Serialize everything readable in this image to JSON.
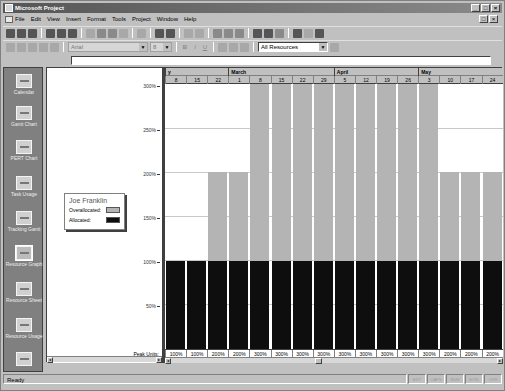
{
  "window": {
    "title": "Microsoft Project",
    "controls": [
      "minimize",
      "maximize",
      "close"
    ],
    "doc_controls": [
      "restore",
      "close"
    ]
  },
  "menu": {
    "items": [
      "File",
      "Edit",
      "View",
      "Insert",
      "Format",
      "Tools",
      "Project",
      "Window",
      "Help"
    ]
  },
  "toolbar": {
    "standard_icons": [
      "new-icon",
      "open-icon",
      "save-icon",
      "print-icon",
      "print-preview-icon",
      "spelling-icon",
      "cut-icon",
      "copy-icon",
      "paste-icon",
      "format-painter-icon",
      "undo-icon",
      "insert-hyperlink-icon",
      "link-tasks-icon",
      "unlink-tasks-icon",
      "split-task-icon",
      "task-information-icon",
      "task-notes-icon",
      "assign-resources-icon",
      "zoom-in-icon",
      "zoom-out-icon",
      "goto-selected-task-icon",
      "copy-picture-icon",
      "gantt-chart-wizard-icon",
      "help-icon"
    ],
    "formatting": {
      "font_value": "Arial",
      "size_value": "8",
      "bold": "B",
      "italic": "I",
      "underline": "U",
      "filter_value": "All Resources"
    }
  },
  "entry_bar": {
    "value": ""
  },
  "view_bar": {
    "items": [
      {
        "label": "Calendar",
        "icon": "calendar-view-icon"
      },
      {
        "label": "Gantt Chart",
        "icon": "gantt-chart-view-icon"
      },
      {
        "label": "PERT Chart",
        "icon": "pert-chart-view-icon"
      },
      {
        "label": "Task Usage",
        "icon": "task-usage-view-icon"
      },
      {
        "label": "Tracking Gantt",
        "icon": "tracking-gantt-view-icon"
      },
      {
        "label": "Resource Graph",
        "icon": "resource-graph-view-icon",
        "selected": true
      },
      {
        "label": "Resource Sheet",
        "icon": "resource-sheet-view-icon"
      },
      {
        "label": "Resource Usage",
        "icon": "resource-usage-view-icon"
      },
      {
        "label": "",
        "icon": "more-views-icon"
      }
    ]
  },
  "legend": {
    "resource_name": "Joe Franklin",
    "overallocated_label": "Overallocated:",
    "allocated_label": "Allocated:",
    "overallocated_color": "#b4b4b4",
    "allocated_color": "#0e0e0e"
  },
  "y_axis": {
    "ticks": [
      "300%",
      "250%",
      "200%",
      "150%",
      "100%",
      "50%"
    ],
    "peak_units_label": "Peak Units:"
  },
  "timescale": {
    "months": [
      {
        "label": "y",
        "start": 0
      },
      {
        "label": "March",
        "start": 3
      },
      {
        "label": "April",
        "start": 8
      },
      {
        "label": "May",
        "start": 12
      }
    ],
    "weeks": [
      "8",
      "15",
      "22",
      "1",
      "8",
      "15",
      "22",
      "29",
      "5",
      "12",
      "19",
      "26",
      "3",
      "10",
      "17",
      "24"
    ]
  },
  "chart_data": {
    "type": "bar",
    "xlabel": "Week (Feb - May)",
    "ylabel": "Peak Units",
    "categories": [
      "Feb 8",
      "Feb 15",
      "Feb 22",
      "Mar 1",
      "Mar 8",
      "Mar 15",
      "Mar 22",
      "Mar 29",
      "Apr 5",
      "Apr 12",
      "Apr 19",
      "Apr 26",
      "May 3",
      "May 10",
      "May 17",
      "May 24"
    ],
    "series": [
      {
        "name": "Allocated",
        "color": "#0e0e0e",
        "values": [
          100,
          100,
          100,
          100,
          100,
          100,
          100,
          100,
          100,
          100,
          100,
          100,
          100,
          100,
          100,
          100
        ]
      },
      {
        "name": "Overallocated",
        "color": "#b4b4b4",
        "values": [
          0,
          0,
          100,
          100,
          200,
          200,
          200,
          200,
          200,
          200,
          200,
          200,
          200,
          100,
          100,
          100
        ]
      }
    ],
    "peak_units": [
      "100%",
      "100%",
      "200%",
      "200%",
      "300%",
      "300%",
      "300%",
      "300%",
      "300%",
      "300%",
      "300%",
      "300%",
      "300%",
      "200%",
      "200%",
      "200%"
    ],
    "ylim": [
      0,
      300
    ],
    "yticks": [
      "50%",
      "100%",
      "150%",
      "200%",
      "250%",
      "300%"
    ],
    "grid": true,
    "stacked": true,
    "legend_position": "left"
  },
  "status_bar": {
    "text": "Ready",
    "indicators": [
      "EXT",
      "CAPS",
      "NUM",
      "SCRL",
      "OVR"
    ]
  }
}
